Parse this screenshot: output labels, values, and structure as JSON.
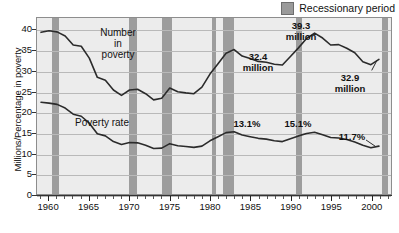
{
  "legend": {
    "label": "Recessionary period",
    "swatch_color": "#9d9d9d",
    "icon": "recession-swatch-icon"
  },
  "axes": {
    "ylabel": "Millions/Percentage in poverty",
    "yticks": [
      "0",
      "5",
      "10",
      "15",
      "20",
      "25",
      "30",
      "35",
      "40"
    ],
    "xticks": [
      "1960",
      "1965",
      "1970",
      "1975",
      "1980",
      "1985",
      "1990",
      "1995",
      "2000"
    ]
  },
  "series_labels": {
    "number_in_poverty": "Number\nin\npoverty",
    "poverty_rate": "Poverty rate"
  },
  "annotations": [
    {
      "name": "annot-32-4-million",
      "text": "32.4\nmillion"
    },
    {
      "name": "annot-39-3-million",
      "text": "39.3\nmillion"
    },
    {
      "name": "annot-32-9-million",
      "text": "32.9\nmillion"
    },
    {
      "name": "annot-13-1-percent",
      "text": "13.1%"
    },
    {
      "name": "annot-15-1-percent",
      "text": "15.1%"
    },
    {
      "name": "annot-11-7-percent",
      "text": "11.7%"
    }
  ],
  "chart_data": {
    "type": "line",
    "title": "",
    "xlabel": "",
    "ylabel": "Millions/Percentage in poverty",
    "xlim": [
      1958.5,
      2002.5
    ],
    "ylim": [
      0,
      43
    ],
    "ytick_values": [
      0,
      5,
      10,
      15,
      20,
      25,
      30,
      35,
      40
    ],
    "xtick_values": [
      1960,
      1965,
      1970,
      1975,
      1980,
      1985,
      1990,
      1995,
      2000
    ],
    "grid": "horizontal",
    "legend_position": "top-right",
    "plot_background": "#ececec",
    "line_color": "#2b2b2b",
    "x": [
      1959,
      1960,
      1961,
      1962,
      1963,
      1964,
      1965,
      1966,
      1967,
      1968,
      1969,
      1970,
      1971,
      1972,
      1973,
      1974,
      1975,
      1976,
      1977,
      1978,
      1979,
      1980,
      1981,
      1982,
      1983,
      1984,
      1985,
      1986,
      1987,
      1988,
      1989,
      1990,
      1991,
      1992,
      1993,
      1994,
      1995,
      1996,
      1997,
      1998,
      1999,
      2000,
      2001
    ],
    "series": [
      {
        "name": "Number in poverty",
        "unit": "millions",
        "values": [
          39.5,
          39.9,
          39.6,
          38.6,
          36.4,
          36.1,
          33.2,
          28.5,
          27.8,
          25.4,
          24.1,
          25.4,
          25.6,
          24.5,
          23.0,
          23.4,
          25.9,
          25.0,
          24.7,
          24.5,
          26.1,
          29.3,
          31.8,
          34.4,
          35.3,
          33.7,
          33.1,
          32.4,
          32.2,
          31.7,
          31.5,
          33.6,
          35.7,
          38.0,
          39.3,
          38.1,
          36.4,
          36.5,
          35.6,
          34.5,
          32.3,
          31.6,
          32.9
        ],
        "label_points": [
          {
            "x": 1986,
            "value": 32.4,
            "label": "32.4 million"
          },
          {
            "x": 1993,
            "value": 39.3,
            "label": "39.3 million"
          },
          {
            "x": 2001,
            "value": 32.9,
            "label": "32.9 million"
          }
        ]
      },
      {
        "name": "Poverty rate",
        "unit": "percent",
        "values": [
          22.4,
          22.2,
          21.9,
          21.0,
          19.5,
          19.0,
          17.3,
          14.7,
          14.2,
          12.8,
          12.1,
          12.6,
          12.5,
          11.9,
          11.1,
          11.2,
          12.3,
          11.8,
          11.6,
          11.4,
          11.7,
          13.0,
          14.0,
          15.0,
          15.2,
          14.4,
          14.0,
          13.6,
          13.4,
          13.0,
          12.8,
          13.5,
          14.2,
          14.8,
          15.1,
          14.5,
          13.8,
          13.7,
          13.3,
          12.7,
          11.9,
          11.3,
          11.7
        ],
        "label_points": [
          {
            "x": 1986,
            "value": 13.1,
            "label": "13.1%"
          },
          {
            "x": 1993,
            "value": 15.1,
            "label": "15.1%"
          },
          {
            "x": 2000,
            "value": 11.7,
            "label": "11.7%"
          }
        ]
      }
    ],
    "recession_bands": [
      {
        "start": 1960.3,
        "end": 1961.2
      },
      {
        "start": 1969.9,
        "end": 1970.9
      },
      {
        "start": 1973.9,
        "end": 1975.2
      },
      {
        "start": 1980.1,
        "end": 1980.6
      },
      {
        "start": 1981.5,
        "end": 1982.9
      },
      {
        "start": 1990.5,
        "end": 1991.2
      },
      {
        "start": 2001.2,
        "end": 2001.9
      }
    ]
  }
}
